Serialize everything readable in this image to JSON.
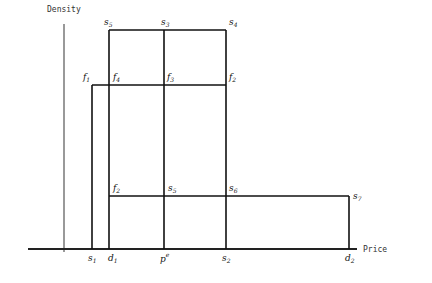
{
  "axes": {
    "y_label": "Density",
    "x_label": "Price"
  },
  "points": {
    "s5_top": {
      "label": "s",
      "sub": "5"
    },
    "s3": {
      "label": "s",
      "sub": "3"
    },
    "s4": {
      "label": "s",
      "sub": "4"
    },
    "f1": {
      "label": "f",
      "sub": "1"
    },
    "f4": {
      "label": "f",
      "sub": "4"
    },
    "f3": {
      "label": "f",
      "sub": "3"
    },
    "f2_right": {
      "label": "f",
      "sub": "2"
    },
    "f2": {
      "label": "f",
      "sub": "2"
    },
    "s5_mid": {
      "label": "s",
      "sub": "5"
    },
    "s6": {
      "label": "s",
      "sub": "6"
    },
    "s7": {
      "label": "s",
      "sub": "7"
    }
  },
  "x_ticks": {
    "s1": {
      "label": "s",
      "sub": "1"
    },
    "d1": {
      "label": "d",
      "sub": "1"
    },
    "pe": {
      "label": "p",
      "sup": "e"
    },
    "s2": {
      "label": "s",
      "sub": "2"
    },
    "d2": {
      "label": "d",
      "sub": "2"
    }
  }
}
